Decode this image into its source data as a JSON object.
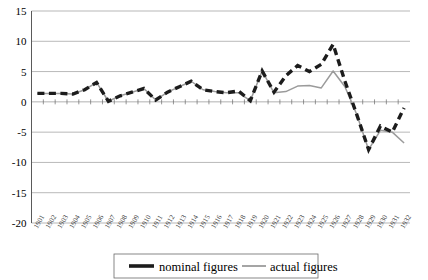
{
  "chart_data": {
    "type": "line",
    "title": "",
    "xlabel": "",
    "ylabel": "",
    "ylim": [
      -20,
      15
    ],
    "ytick_step": 5,
    "yticks": [
      "15",
      "10",
      "5",
      "0",
      "-5",
      "-10",
      "-15",
      "-20"
    ],
    "grid": true,
    "legend_position": "bottom",
    "categories": [
      "1901",
      "1902",
      "1903",
      "1904",
      "1905",
      "1906",
      "1907",
      "1908",
      "1909",
      "1910",
      "1911",
      "1912",
      "1913",
      "1914",
      "1915",
      "1916",
      "1917",
      "1918",
      "1919",
      "1920",
      "1921",
      "1922",
      "1923",
      "1924",
      "1925",
      "1926",
      "1927",
      "1928",
      "1929",
      "1930",
      "1931",
      "1932"
    ],
    "series": [
      {
        "name": "nominal figures",
        "color": "#1c1c1c",
        "style": "dashed",
        "values": [
          1.4,
          1.4,
          1.4,
          1.3,
          2.0,
          3.2,
          0.1,
          1.0,
          1.6,
          2.2,
          0.3,
          1.6,
          2.5,
          3.4,
          2.0,
          1.7,
          1.5,
          1.8,
          0.2,
          5.1,
          1.6,
          4.3,
          6.0,
          5.0,
          6.2,
          9.5,
          3.4,
          -2.1,
          -7.9,
          -4.0,
          -5.0,
          -1.0
        ]
      },
      {
        "name": "actual figures",
        "color": "#9b9b9b",
        "style": "solid",
        "values": [
          1.4,
          1.4,
          1.4,
          1.3,
          2.0,
          3.2,
          0.1,
          1.0,
          1.6,
          2.2,
          0.3,
          1.6,
          2.5,
          3.4,
          2.0,
          1.7,
          1.5,
          1.5,
          0.2,
          5.1,
          1.5,
          1.7,
          2.6,
          2.7,
          2.3,
          5.1,
          2.5,
          -2.1,
          -7.9,
          -4.7,
          -5.0,
          -6.8
        ]
      }
    ]
  },
  "legend": {
    "entries": [
      {
        "label": "nominal figures"
      },
      {
        "label": "actual figures"
      }
    ]
  }
}
